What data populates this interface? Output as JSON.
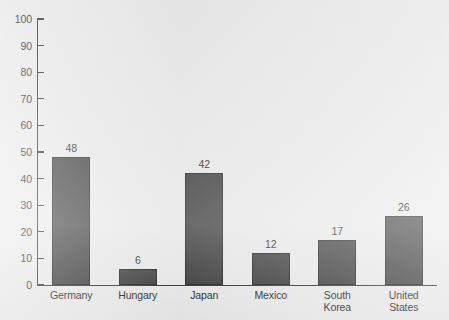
{
  "chart_data": {
    "type": "bar",
    "title": "",
    "subtitle": "",
    "xlabel": "",
    "ylabel": "",
    "ylim": [
      0,
      100
    ],
    "ytick_step": 10,
    "grid": false,
    "legend": false,
    "categories": [
      "Germany",
      "Hungary",
      "Japan",
      "Mexico",
      "South Korea",
      "United States"
    ],
    "values": [
      48,
      6,
      42,
      12,
      17,
      26
    ],
    "value_labels": [
      "48",
      "6",
      "42",
      "12",
      "17",
      "26"
    ],
    "category_label_lines": [
      [
        "Germany"
      ],
      [
        "Hungary"
      ],
      [
        "Japan"
      ],
      [
        "Mexico"
      ],
      [
        "South",
        "Korea"
      ],
      [
        "United",
        "States"
      ]
    ],
    "ytick_labels": [
      "100",
      "90",
      "80",
      "70",
      "60",
      "50",
      "40",
      "30",
      "20",
      "10",
      "0"
    ],
    "ytick_values": [
      100,
      90,
      80,
      70,
      60,
      50,
      40,
      30,
      20,
      10,
      0
    ],
    "colors": {
      "bar_fill": "#363636",
      "bar_stroke": "#1a1a1a",
      "axis": "#2b2b2b",
      "text": "#1c1c1c",
      "background": "#ebeaea"
    }
  }
}
